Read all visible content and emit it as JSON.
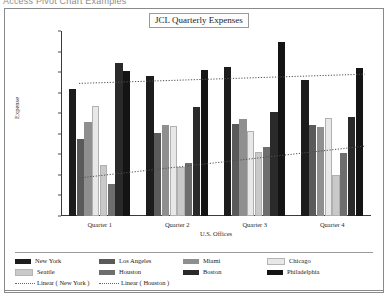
{
  "document": {
    "top_strip_text": "Access Pivot Chart Examples"
  },
  "chart": {
    "title": "JCL Quarterly Expenses",
    "y_axis_title": "Expense",
    "x_axis_title": "U.S. Offices"
  },
  "chart_data": {
    "type": "bar",
    "title": "JCL Quarterly Expenses",
    "xlabel": "U.S. Offices",
    "ylabel": "Expense",
    "ylim": [
      0,
      9000
    ],
    "ytick_values": [
      0,
      1000,
      2000,
      3000,
      4000,
      5000,
      6000,
      7000,
      8000,
      9000
    ],
    "ytick_labels": [
      "$-",
      "$1,000.00",
      "$2,000.00",
      "$3,000.00",
      "$4,000.00",
      "$5,000.00",
      "$6,000.00",
      "$7,000.00",
      "$8,000.00",
      "$9,000.00"
    ],
    "grid": false,
    "legend_position": "bottom",
    "categories": [
      "Quarter 1",
      "Quarter 2",
      "Quarter 3",
      "Quarter 4"
    ],
    "series": [
      {
        "name": "New York",
        "color": "#1c1c1c",
        "values": [
          6200,
          6800,
          7250,
          6600
        ]
      },
      {
        "name": "Los Angeles",
        "color": "#5a5a5a",
        "values": [
          3750,
          4050,
          4500,
          4450
        ]
      },
      {
        "name": "Miami",
        "color": "#8f8f8f",
        "values": [
          4550,
          4450,
          4700,
          4350
        ]
      },
      {
        "name": "Chicago",
        "color": "#e8e8e8",
        "values": [
          5350,
          4400,
          4150,
          4750
        ]
      },
      {
        "name": "Seattle",
        "color": "#c9c9c9",
        "values": [
          2500,
          2400,
          3100,
          2000
        ]
      },
      {
        "name": "Houston",
        "color": "#6e6e6e",
        "values": [
          1550,
          2600,
          3350,
          3050
        ]
      },
      {
        "name": "Boston",
        "color": "#2a2a2a",
        "values": [
          7450,
          5300,
          5050,
          4800
        ]
      },
      {
        "name": "Philadelphia",
        "color": "#141414",
        "values": [
          7050,
          7100,
          8450,
          7200
        ]
      }
    ],
    "trendlines": [
      {
        "name": "Linear ( New York )",
        "style": "dotted",
        "y_start": 6450,
        "y_end": 6900
      },
      {
        "name": "Linear ( Houston )",
        "style": "dotted",
        "y_start": 1850,
        "y_end": 3400
      }
    ]
  },
  "legend": {
    "row1": [
      {
        "label": "New York",
        "color": "#1c1c1c"
      },
      {
        "label": "Los Angeles",
        "color": "#5a5a5a"
      },
      {
        "label": "Miami",
        "color": "#8f8f8f"
      },
      {
        "label": "Chicago",
        "color": "#e8e8e8"
      }
    ],
    "row2": [
      {
        "label": "Seattle",
        "color": "#c9c9c9"
      },
      {
        "label": "Houston",
        "color": "#6e6e6e"
      },
      {
        "label": "Boston",
        "color": "#2a2a2a"
      },
      {
        "label": "Philadelphia",
        "color": "#141414"
      }
    ],
    "row3": [
      {
        "label": "Linear ( New York )"
      },
      {
        "label": "Linear ( Houston )"
      }
    ]
  }
}
